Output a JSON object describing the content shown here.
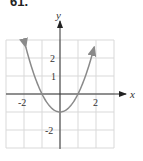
{
  "problem_number": "61.",
  "chart_data": {
    "type": "line",
    "title": "",
    "function": "y = x^2 - 1",
    "xlabel": "x",
    "ylabel": "y",
    "xlim": [
      -3,
      3
    ],
    "ylim": [
      -3,
      3
    ],
    "grid": true,
    "x_tick_labels": [
      "-2",
      "2"
    ],
    "y_tick_labels": [
      "2",
      "1",
      "-2"
    ],
    "series": [
      {
        "name": "parabola",
        "x": [
          -1.9,
          -1.5,
          -1,
          -0.5,
          0,
          0.5,
          1,
          1.5,
          1.9
        ],
        "y": [
          2.61,
          1.25,
          0,
          -0.75,
          -1,
          -0.75,
          0,
          1.25,
          2.61
        ],
        "color": "#8a8a8a",
        "arrows_at_ends": true
      }
    ]
  },
  "colors": {
    "grid": "#d9d9d9",
    "axis": "#333333",
    "curve": "#8a8a8a"
  }
}
